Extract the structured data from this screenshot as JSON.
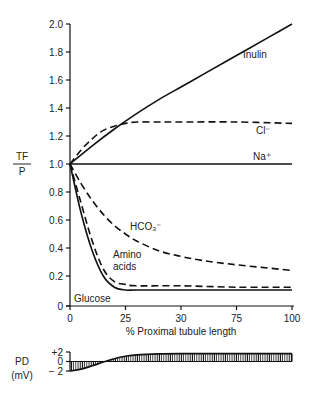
{
  "chart_data": [
    {
      "type": "line",
      "title": "",
      "xlabel": "% Proximal tubule length",
      "ylabel_numerator": "TF",
      "ylabel_denominator": "P",
      "xlim": [
        0,
        100
      ],
      "ylim": [
        0,
        2.0
      ],
      "grid": false,
      "x_ticks": [
        0,
        25,
        50,
        75,
        100
      ],
      "x_tick_labels": [
        "0",
        "25",
        "30",
        "75",
        "100"
      ],
      "y_ticks": [
        0,
        0.2,
        0.4,
        0.6,
        0.8,
        1.0,
        1.2,
        1.4,
        1.6,
        1.8,
        2.0
      ],
      "y_tick_labels": [
        "0",
        "0.2",
        "0.4",
        "0.6",
        "0.8",
        "1.0",
        "1.2",
        "1.4",
        "1.6",
        "1.8",
        "2.0"
      ],
      "series": [
        {
          "name": "Inulin",
          "label": "Inulin",
          "style": "solid",
          "x": [
            0,
            10,
            20,
            30,
            40,
            50,
            60,
            70,
            80,
            90,
            100
          ],
          "y": [
            1.0,
            1.13,
            1.25,
            1.36,
            1.46,
            1.55,
            1.64,
            1.73,
            1.82,
            1.91,
            2.0
          ]
        },
        {
          "name": "Cl-",
          "label": "Cl⁻",
          "style": "dashed",
          "x": [
            0,
            5,
            10,
            15,
            20,
            25,
            30,
            40,
            50,
            75,
            100
          ],
          "y": [
            1.0,
            1.1,
            1.18,
            1.24,
            1.27,
            1.29,
            1.3,
            1.3,
            1.3,
            1.3,
            1.29
          ]
        },
        {
          "name": "Na+",
          "label": "Na⁺",
          "style": "solid",
          "x": [
            0,
            100
          ],
          "y": [
            1.0,
            1.0
          ]
        },
        {
          "name": "HCO3-",
          "label": "HCO₃⁻",
          "style": "dashed",
          "x": [
            0,
            5,
            10,
            15,
            20,
            25,
            30,
            40,
            50,
            60,
            75,
            100
          ],
          "y": [
            1.0,
            0.86,
            0.74,
            0.64,
            0.56,
            0.5,
            0.45,
            0.38,
            0.34,
            0.31,
            0.28,
            0.24
          ]
        },
        {
          "name": "Amino acids",
          "label": "Amino acids",
          "style": "dashed",
          "x": [
            0,
            5,
            10,
            15,
            20,
            25,
            30,
            50,
            75,
            100
          ],
          "y": [
            1.0,
            0.72,
            0.45,
            0.25,
            0.16,
            0.14,
            0.13,
            0.13,
            0.12,
            0.12
          ]
        },
        {
          "name": "Glucose",
          "label": "Glucose",
          "style": "solid",
          "x": [
            0,
            5,
            10,
            15,
            20,
            25,
            30,
            50,
            75,
            100
          ],
          "y": [
            1.0,
            0.65,
            0.38,
            0.2,
            0.12,
            0.1,
            0.1,
            0.1,
            0.1,
            0.1
          ]
        }
      ]
    },
    {
      "type": "area",
      "title": "",
      "ylabel": "PD",
      "ylabel_units": "(mV)",
      "xlim": [
        0,
        100
      ],
      "ylim": [
        -2,
        2
      ],
      "y_ticks": [
        2,
        0,
        -2
      ],
      "y_tick_labels": [
        "+2",
        "0",
        "− 2"
      ],
      "fill": "vertical hatching",
      "series": [
        {
          "name": "PD",
          "x": [
            0,
            5,
            10,
            15,
            20,
            25,
            30,
            40,
            50,
            75,
            100
          ],
          "y": [
            -2.0,
            -1.6,
            -0.9,
            -0.1,
            0.6,
            1.1,
            1.4,
            1.6,
            1.65,
            1.65,
            1.65
          ]
        }
      ]
    }
  ]
}
